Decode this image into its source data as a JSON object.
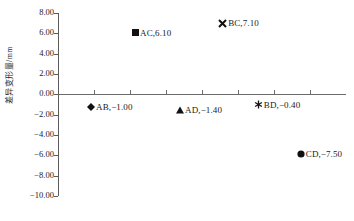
{
  "chart_data": {
    "type": "scatter",
    "title": "",
    "xlabel": "",
    "ylabel": "差异变形量/mm",
    "ylim": [
      -10.0,
      8.0
    ],
    "y_ticks": [
      "8.00",
      "6.00",
      "4.00",
      "2.00",
      "0.00",
      "-2.00",
      "-4.00",
      "-6.00",
      "-8.00",
      "-10.00"
    ],
    "y_tick_values": [
      8.0,
      6.0,
      4.0,
      2.0,
      0.0,
      -2.0,
      -4.0,
      -6.0,
      -8.0,
      -10.0
    ],
    "x_ticks_count": 7,
    "x_tick_labels": [
      "",
      "",
      "",
      "",
      "",
      "",
      ""
    ],
    "grid": false,
    "legend_position": "none",
    "categories": [
      "AB",
      "AC",
      "AD",
      "BC",
      "BD",
      "CD"
    ],
    "values": [
      -1.0,
      6.1,
      -1.4,
      7.1,
      -0.4,
      -7.5
    ],
    "points": [
      {
        "name": "AB",
        "value": "-1.00",
        "label": "AB,−1.00",
        "marker": "diamond",
        "x_frac": 0.115,
        "y_plot": -1.2
      },
      {
        "name": "AC",
        "value": "6.10",
        "label": "AC,6.10",
        "marker": "square",
        "x_frac": 0.271,
        "y_plot": 6.05
      },
      {
        "name": "AD",
        "value": "-1.40",
        "label": "AD,−1.40",
        "marker": "triangle",
        "x_frac": 0.424,
        "y_plot": -1.5
      },
      {
        "name": "BC",
        "value": "7.10",
        "label": "BC,7.10",
        "marker": "cross",
        "x_frac": 0.57,
        "y_plot": 7.0
      },
      {
        "name": "BD",
        "value": "-0.40",
        "label": "BD,−0.40",
        "marker": "asterisk",
        "x_frac": 0.694,
        "y_plot": -1.0
      },
      {
        "name": "CD",
        "value": "-7.50",
        "label": "CD,−7.50",
        "marker": "circle",
        "x_frac": 0.843,
        "y_plot": -5.85
      }
    ]
  },
  "colors": {
    "axis": "#5a5a5a",
    "marker": "#111111",
    "text": "#1a1a1a",
    "background": "#ffffff"
  }
}
